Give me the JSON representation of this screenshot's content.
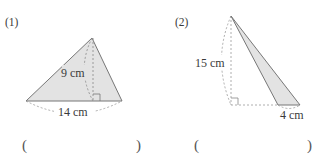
{
  "problems": [
    {
      "number": "(1)",
      "height_label": "9 cm",
      "base_label": "14 cm",
      "answer_open": "(",
      "answer_close": ")",
      "answer_value": ""
    },
    {
      "number": "(2)",
      "height_label": "15 cm",
      "base_label": "4 cm",
      "answer_open": "(",
      "answer_close": ")",
      "answer_value": ""
    }
  ],
  "colors": {
    "fill": "#e3e3e3",
    "stroke": "#777777",
    "dashed": "#9a9a9a"
  }
}
